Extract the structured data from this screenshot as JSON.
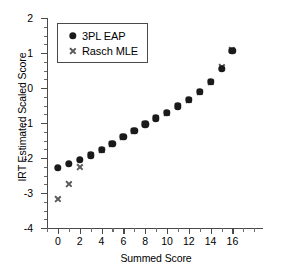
{
  "chart_data": {
    "type": "scatter",
    "title": "",
    "xlabel": "Summed Score",
    "ylabel": "IRT Estimated Scaled Score",
    "xlim": [
      -1,
      18.8
    ],
    "ylim": [
      -4,
      2
    ],
    "xticks": [
      "0",
      "2",
      "4",
      "6",
      "8",
      "10",
      "12",
      "14",
      "16"
    ],
    "xtick_values": [
      0,
      2,
      4,
      6,
      8,
      10,
      12,
      14,
      16
    ],
    "yticks": [
      "2",
      "1",
      "0",
      "-1",
      "-2",
      "-3",
      "-4"
    ],
    "ytick_values": [
      2,
      1,
      0,
      -1,
      -2,
      -3,
      -4
    ],
    "x_minor_step": 1,
    "y_minor_step": 0.25,
    "grid": false,
    "legend_position": "upper left",
    "x": [
      0,
      1,
      2,
      3,
      4,
      5,
      6,
      7,
      8,
      9,
      10,
      11,
      12,
      13,
      14,
      15,
      16
    ],
    "series": [
      {
        "name": "3PL EAP",
        "marker": "circle",
        "color": "#1a1a1a",
        "values": [
          -2.28,
          -2.17,
          -2.06,
          -1.92,
          -1.76,
          -1.6,
          -1.4,
          -1.22,
          -1.04,
          -0.87,
          -0.71,
          -0.52,
          -0.33,
          -0.11,
          0.18,
          0.55,
          1.07
        ]
      },
      {
        "name": "Rasch MLE",
        "marker": "cross",
        "color": "#5c5c5c",
        "values": [
          -3.16,
          -2.74,
          -2.26,
          -1.92,
          -1.76,
          -1.59,
          -1.39,
          -1.22,
          -1.04,
          -0.87,
          -0.71,
          -0.52,
          -0.33,
          -0.11,
          0.18,
          0.59,
          1.08
        ]
      }
    ]
  },
  "legend": {
    "items": [
      {
        "label": "3PL EAP",
        "marker": "circle"
      },
      {
        "label": "Rasch MLE",
        "marker": "cross"
      }
    ]
  }
}
